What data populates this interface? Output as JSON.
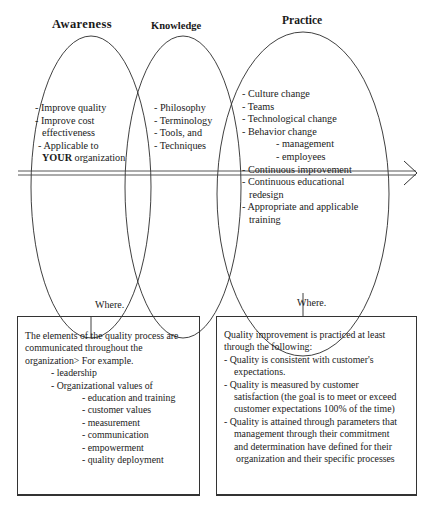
{
  "headings": {
    "awareness": "Awareness",
    "knowledge": "Knowledge",
    "practice": "Practice"
  },
  "awareness_items": [
    "- Improve quality",
    "- Improve cost",
    "effectiveness",
    "- Applicable to",
    "YOUR",
    " organization"
  ],
  "knowledge_items": [
    "- Philosophy",
    "- Terminology",
    "- Tools, and",
    "- Techniques"
  ],
  "practice_items": [
    "- Culture change",
    "- Teams",
    "- Technological change",
    "- Behavior change",
    "- management",
    "- employees",
    "- Continuous improvement",
    "- Continuous educational",
    "redesign",
    "- Appropriate and applicable",
    "training"
  ],
  "where_labels": {
    "left": "Where.",
    "right": "Where."
  },
  "left_box": {
    "intro": [
      "The elements of the quality process are",
      "communicated throughout the",
      "organization> For example."
    ],
    "level1": [
      "- leadership",
      "- Organizational values of"
    ],
    "level2": [
      "- education and training",
      "- customer values",
      "- measurement",
      "- communication",
      "- empowerment",
      "- quality deployment"
    ]
  },
  "right_box": {
    "intro": [
      "Quality improvement is practiced at least",
      "through the following:"
    ],
    "items": [
      "- Quality is consistent with customer's",
      "expectations.",
      "- Quality is measured by customer",
      "satisfaction (the goal is to meet or exceed",
      "customer expectations 100% of the time)",
      "- Quality is attained through parameters that",
      "management through their commitment",
      "and determination have defined for their",
      "organization and their specific processes"
    ]
  },
  "colors": {
    "line": "#2a2a2a",
    "text": "#1a1a1a",
    "background": "#ffffff"
  }
}
